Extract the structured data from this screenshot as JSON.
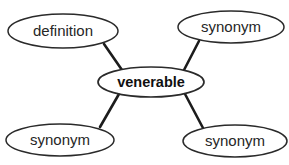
{
  "diagram": {
    "type": "word-web",
    "background_color": "#ffffff",
    "stroke_color": "#2a2a2a",
    "edge_color": "#1c1c1c",
    "text_color": "#262626",
    "center_text_color": "#101010",
    "center_node": {
      "id": "center",
      "label": "venerable",
      "role": "word",
      "bold": true,
      "cx": 151,
      "cy": 82,
      "rx": 53,
      "ry": 15
    },
    "outer_nodes": [
      {
        "id": "definition",
        "label": "definition",
        "role": "definition",
        "bold": false,
        "position": "top-left",
        "cx": 63,
        "cy": 31,
        "rx": 55,
        "ry": 17
      },
      {
        "id": "synonym-top-right",
        "label": "synonym",
        "role": "synonym",
        "bold": false,
        "position": "top-right",
        "cx": 231,
        "cy": 27,
        "rx": 53,
        "ry": 16
      },
      {
        "id": "synonym-bottom-left",
        "label": "synonym",
        "role": "synonym",
        "bold": false,
        "position": "bottom-left",
        "cx": 60,
        "cy": 140,
        "rx": 54,
        "ry": 16
      },
      {
        "id": "synonym-bottom-right",
        "label": "synonym",
        "role": "synonym",
        "bold": false,
        "position": "bottom-right",
        "cx": 235,
        "cy": 141,
        "rx": 52,
        "ry": 16
      }
    ],
    "edges": [
      {
        "id": "edge-definition",
        "from": "definition",
        "to": "center",
        "x1": 104,
        "y1": 44,
        "x2": 122,
        "y2": 70
      },
      {
        "id": "edge-synonym-top-right",
        "from": "synonym-top-right",
        "to": "center",
        "x1": 199,
        "y1": 41,
        "x2": 184,
        "y2": 70
      },
      {
        "id": "edge-synonym-bottom-left",
        "from": "synonym-bottom-left",
        "to": "center",
        "x1": 119,
        "y1": 94,
        "x2": 100,
        "y2": 127
      },
      {
        "id": "edge-synonym-bottom-right",
        "from": "synonym-bottom-right",
        "to": "center",
        "x1": 185,
        "y1": 94,
        "x2": 203,
        "y2": 128
      }
    ]
  }
}
